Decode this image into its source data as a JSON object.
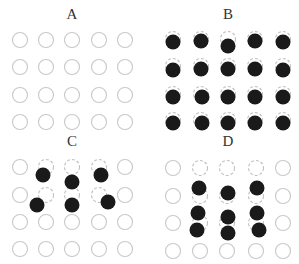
{
  "figure": {
    "colors": {
      "empty_outline": "#c8c8c8",
      "dashed_outline": "#c0c0c0",
      "filled": "#1a1a1a",
      "label": "#333333",
      "background": "#ffffff"
    },
    "circle_radius": 7.5,
    "filled_radius": 7.5,
    "panels": [
      {
        "id": "A",
        "label": "A",
        "label_pos": [
          72,
          19
        ],
        "cols_x": [
          20,
          46,
          72,
          99,
          125
        ],
        "rows_y": [
          40,
          67,
          95,
          122
        ],
        "dashed": [],
        "filled": []
      },
      {
        "id": "B",
        "label": "B",
        "label_pos": [
          228,
          19
        ],
        "cols_x": [
          173,
          201,
          228,
          255,
          283
        ],
        "rows_y": [
          39,
          66,
          94,
          120
        ],
        "all_dashed": true,
        "dashed": [],
        "filled": [
          [
            173,
            42
          ],
          [
            201,
            41
          ],
          [
            228,
            46
          ],
          [
            255,
            41
          ],
          [
            283,
            42
          ],
          [
            173,
            70
          ],
          [
            201,
            69
          ],
          [
            228,
            69
          ],
          [
            255,
            69
          ],
          [
            283,
            70
          ],
          [
            173,
            97
          ],
          [
            202,
            97
          ],
          [
            228,
            97
          ],
          [
            255,
            97
          ],
          [
            283,
            97
          ],
          [
            173,
            123
          ],
          [
            202,
            123
          ],
          [
            228,
            123
          ],
          [
            255,
            123
          ],
          [
            283,
            123
          ]
        ]
      },
      {
        "id": "C",
        "label": "C",
        "label_pos": [
          72,
          146
        ],
        "cols_x": [
          20,
          46,
          72,
          99,
          125
        ],
        "rows_y": [
          167,
          195,
          222,
          249
        ],
        "dashed": [
          [
            1,
            0
          ],
          [
            2,
            0
          ],
          [
            3,
            0
          ],
          [
            1,
            1
          ],
          [
            2,
            1
          ],
          [
            3,
            1
          ]
        ],
        "filled": [
          [
            43,
            175
          ],
          [
            72,
            182
          ],
          [
            101,
            175
          ],
          [
            37,
            205
          ],
          [
            72,
            205
          ],
          [
            108,
            202
          ]
        ]
      },
      {
        "id": "D",
        "label": "D",
        "label_pos": [
          228,
          146
        ],
        "cols_x": [
          173,
          200,
          227,
          256,
          283
        ],
        "rows_y": [
          168,
          196,
          223,
          251
        ],
        "dashed": [
          [
            1,
            0
          ],
          [
            2,
            0
          ],
          [
            3,
            0
          ],
          [
            1,
            1
          ],
          [
            2,
            1
          ],
          [
            3,
            1
          ],
          [
            1,
            2
          ],
          [
            2,
            2
          ],
          [
            3,
            2
          ]
        ],
        "filled": [
          [
            199,
            188
          ],
          [
            228,
            193
          ],
          [
            257,
            188
          ],
          [
            198,
            213
          ],
          [
            228,
            217
          ],
          [
            257,
            213
          ],
          [
            197,
            230
          ],
          [
            228,
            233
          ],
          [
            259,
            230
          ]
        ]
      }
    ]
  }
}
